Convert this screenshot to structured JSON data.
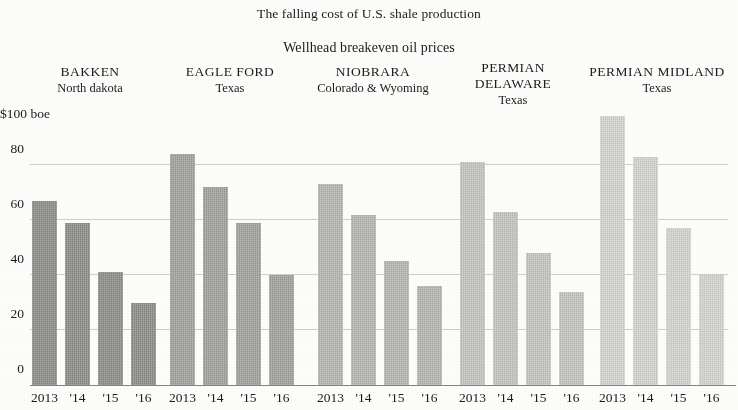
{
  "chart_data": {
    "type": "bar",
    "title": "The falling cost of U.S. shale production",
    "subtitle": "Wellhead breakeven oil prices",
    "xlabel": "",
    "ylabel": "$100 boe",
    "ylim": [
      0,
      100
    ],
    "grid": true,
    "legend_position": "none",
    "y_ticks": [
      "80",
      "60",
      "40",
      "20",
      "0"
    ],
    "y_tick_values": [
      80,
      60,
      40,
      20,
      0
    ],
    "y_axis_top_label": "$100 boe",
    "categories": [
      "2013",
      "'14",
      "'15",
      "'16"
    ],
    "series": [
      {
        "name": "BAKKEN",
        "region": "North dakota",
        "color": "#8e8e8c",
        "values": [
          67,
          59,
          41,
          30
        ]
      },
      {
        "name": "EAGLE FORD",
        "region": "Texas",
        "color": "#a2a2a0",
        "values": [
          84,
          72,
          59,
          40
        ]
      },
      {
        "name": "NIOBRARA",
        "region": "Colorado & Wyoming",
        "color": "#b6b6b3",
        "values": [
          73,
          62,
          45,
          36
        ]
      },
      {
        "name": "PERMIAN DELAWARE",
        "name_line1": "PERMIAN",
        "name_line2": "DELAWARE",
        "region": "Texas",
        "color": "#c6c6c3",
        "values": [
          81,
          63,
          48,
          34
        ]
      },
      {
        "name": "PERMIAN MIDLAND",
        "region": "Texas",
        "color": "#d5d5d2",
        "values": [
          98,
          83,
          57,
          40
        ]
      }
    ]
  },
  "groups": [
    {
      "name": "BAKKEN",
      "region": "North dakota"
    },
    {
      "name": "EAGLE FORD",
      "region": "Texas"
    },
    {
      "name": "NIOBRARA",
      "region": "Colorado & Wyoming"
    },
    {
      "name": "PERMIAN DELAWARE",
      "region": "Texas"
    },
    {
      "name": "PERMIAN MIDLAND",
      "region": "Texas"
    }
  ],
  "header": {
    "title": "The falling cost of U.S. shale production",
    "subtitle": "Wellhead breakeven oil prices"
  },
  "permian_delaware_head": {
    "line1": "PERMIAN",
    "line2": "DELAWARE",
    "line3": "Texas"
  }
}
